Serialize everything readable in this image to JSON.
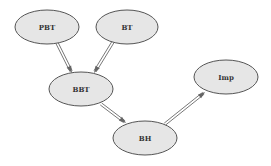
{
  "diagram": {
    "type": "directed-graph",
    "colors": {
      "node_fill": "#e6e6e6",
      "node_stroke": "#555555",
      "edge": "#555555",
      "label": "#333333"
    },
    "nodes": [
      {
        "id": "PBT",
        "label": "PBT",
        "cx": 47,
        "cy": 27,
        "rx": 32,
        "ry": 17
      },
      {
        "id": "BT",
        "label": "BT",
        "cx": 127,
        "cy": 27,
        "rx": 31,
        "ry": 17
      },
      {
        "id": "BBT",
        "label": "BBT",
        "cx": 81,
        "cy": 89,
        "rx": 32,
        "ry": 17
      },
      {
        "id": "BH",
        "label": "BH",
        "cx": 145,
        "cy": 138,
        "rx": 32,
        "ry": 17
      },
      {
        "id": "Imp",
        "label": "Imp",
        "cx": 226,
        "cy": 77,
        "rx": 32,
        "ry": 17
      }
    ],
    "edges": [
      {
        "from": "PBT",
        "to": "BBT",
        "x1": 57,
        "y1": 43,
        "x2": 72,
        "y2": 73
      },
      {
        "from": "BT",
        "to": "BBT",
        "x1": 113,
        "y1": 42,
        "x2": 94,
        "y2": 73
      },
      {
        "from": "BBT",
        "to": "BH",
        "x1": 101,
        "y1": 104,
        "x2": 126,
        "y2": 123
      },
      {
        "from": "BH",
        "to": "Imp",
        "x1": 165,
        "y1": 124,
        "x2": 205,
        "y2": 92
      }
    ]
  }
}
